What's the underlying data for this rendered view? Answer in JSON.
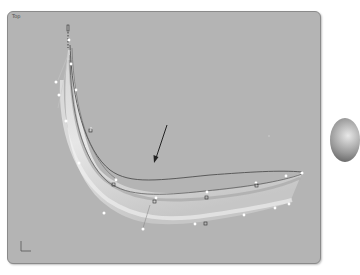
{
  "viewport": {
    "label": "Top",
    "background": "#b4b4b4"
  },
  "scene": {
    "object": "swept curved surface with control points",
    "arrow": "direction-arrow",
    "axis_icon": "world-axis-icon"
  },
  "side_object": "partial shaded sphere"
}
